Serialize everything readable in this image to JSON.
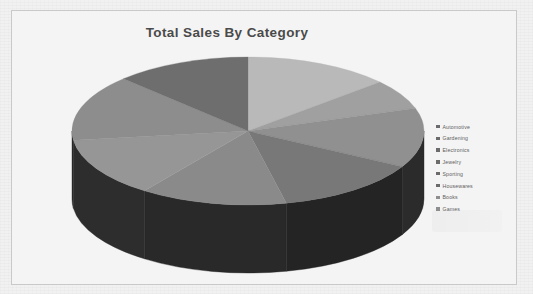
{
  "document": {
    "background_color": "#f1f1f1",
    "frame_border_color": "#c9c9c9",
    "frame_background": "#f4f4f4"
  },
  "chart_data": {
    "type": "pie",
    "title": "Total Sales By Category",
    "subtitle": "",
    "xlabel": "",
    "ylabel": "",
    "three_d": true,
    "grid": false,
    "legend_position": "right",
    "start_angle_deg": -90,
    "direction": "clockwise",
    "categories": [
      "Automotive",
      "Gardening",
      "Electronics",
      "Jewelry",
      "Sporting",
      "Housewares",
      "Books",
      "Games"
    ],
    "values": [
      13.5,
      6.5,
      13.0,
      13.5,
      13.5,
      13.0,
      14.5,
      12.5
    ],
    "value_unit": "percent",
    "slices": [
      {
        "label": "Automotive",
        "value": 13.5,
        "color": "#b9b9b9",
        "start_deg": -90,
        "end_deg": -41.4
      },
      {
        "label": "Gardening",
        "value": 6.5,
        "color": "#a0a0a0",
        "start_deg": -41.4,
        "end_deg": -18.0
      },
      {
        "label": "Electronics",
        "value": 13.0,
        "color": "#909090",
        "start_deg": -18.0,
        "end_deg": 28.8
      },
      {
        "label": "Jewelry",
        "value": 13.5,
        "color": "#787878",
        "start_deg": 28.8,
        "end_deg": 77.4
      },
      {
        "label": "Sporting",
        "value": 13.5,
        "color": "#8a8a8a",
        "start_deg": 77.4,
        "end_deg": 126.0
      },
      {
        "label": "Housewares",
        "value": 13.0,
        "color": "#969696",
        "start_deg": 126.0,
        "end_deg": 172.8
      },
      {
        "label": "Books",
        "value": 14.5,
        "color": "#8d8d8d",
        "start_deg": 172.8,
        "end_deg": 225.0
      },
      {
        "label": "Games",
        "value": 12.5,
        "color": "#6e6e6e",
        "start_deg": 225.0,
        "end_deg": 270.0
      }
    ],
    "legend_entries": [
      {
        "label": "Automotive",
        "color": "#6b6b6b"
      },
      {
        "label": "Gardening",
        "color": "#6b6b6b"
      },
      {
        "label": "Electronics",
        "color": "#6b6b6b"
      },
      {
        "label": "Jewelry",
        "color": "#6b6b6b"
      },
      {
        "label": "Sporting",
        "color": "#6b6b6b"
      },
      {
        "label": "Housewares",
        "color": "#6b6b6b"
      },
      {
        "label": "Books",
        "color": "#8e8e8e"
      },
      {
        "label": "Games",
        "color": "#8e8e8e"
      }
    ],
    "geometry": {
      "center_x": 236,
      "center_y": 120,
      "radius_x": 176,
      "radius_y": 74,
      "depth": 68
    },
    "title_color": "#4a4a4a",
    "side_wall_color": "#2a2a2a"
  }
}
